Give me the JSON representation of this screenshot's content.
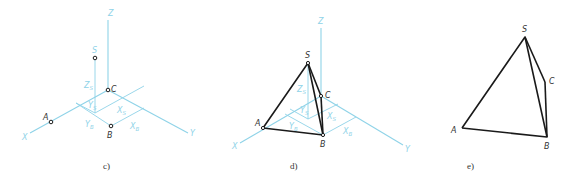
{
  "colors": {
    "axis": "#8fd3e8",
    "edge": "#1a1a1a"
  },
  "panels": [
    {
      "caption": "c)",
      "axis_labels": {
        "x": "X",
        "y": "Y",
        "z": "Z"
      },
      "points": {
        "S": "S",
        "A": "A",
        "B": "B",
        "C": "C"
      },
      "coord_labels": {
        "zs": "Z",
        "zs_sub": "S",
        "ys": "Y",
        "ys_sub": "S",
        "xs": "X",
        "xs_sub": "S",
        "yb": "Y",
        "yb_sub": "B",
        "xb": "X",
        "xb_sub": "B"
      }
    },
    {
      "caption": "d)",
      "axis_labels": {
        "x": "X",
        "y": "Y",
        "z": "Z"
      },
      "points": {
        "S": "S",
        "A": "A",
        "B": "B",
        "C": "C"
      },
      "coord_labels": {
        "zs": "Z",
        "zs_sub": "S",
        "ys": "Y",
        "ys_sub": "S",
        "xs": "X",
        "xs_sub": "S",
        "yb": "Y",
        "yb_sub": "B",
        "xb": "X",
        "xb_sub": "B"
      }
    },
    {
      "caption": "e)",
      "points": {
        "S": "S",
        "A": "A",
        "B": "B",
        "C": "C"
      }
    }
  ]
}
